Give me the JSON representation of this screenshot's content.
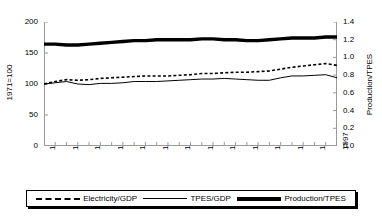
{
  "chart_data": {
    "type": "line",
    "title": "",
    "xlabel": "",
    "ylabel_left": "1971=100",
    "ylabel_right": "Production/TPES",
    "grid": false,
    "legend_position": "bottom",
    "xlim": [
      1971,
      1997
    ],
    "ylim_left": [
      0,
      200
    ],
    "ylim_right": [
      0.0,
      1.4
    ],
    "yticks_left": [
      "0",
      "50",
      "100",
      "150",
      "200"
    ],
    "yticks_right": [
      "0.0",
      "0.2",
      "0.4",
      "0.6",
      "0.8",
      "1.0",
      "1.2",
      "1.4"
    ],
    "x": [
      1971,
      1972,
      1973,
      1974,
      1975,
      1976,
      1977,
      1978,
      1979,
      1980,
      1981,
      1982,
      1983,
      1984,
      1985,
      1986,
      1987,
      1988,
      1989,
      1990,
      1991,
      1992,
      1993,
      1994,
      1995,
      1996,
      1997
    ],
    "xticks": [
      "1971",
      "1972",
      "1973",
      "1974",
      "1975",
      "1976",
      "1977",
      "1978",
      "1979",
      "1980",
      "1981",
      "1982",
      "1983",
      "1984",
      "1985",
      "1986",
      "1987",
      "1988",
      "1989",
      "1990",
      "1991",
      "1992",
      "1993",
      "1994",
      "1995",
      "1996",
      "1997"
    ],
    "xtick_labels_shown": [
      "1971",
      "1973",
      "1975",
      "1977",
      "1979",
      "1981",
      "1983",
      "1985",
      "1987",
      "1989",
      "1991",
      "1993",
      "1995",
      "1997"
    ],
    "series": [
      {
        "name": "Electricity/GDP",
        "style": "dashed",
        "axis": "left",
        "values": [
          100,
          104,
          107,
          106,
          107,
          109,
          110,
          111,
          112,
          113,
          113,
          113,
          114,
          115,
          117,
          117,
          118,
          119,
          119,
          120,
          121,
          124,
          127,
          129,
          131,
          133,
          130
        ]
      },
      {
        "name": "TPES/GDP",
        "style": "thin-solid",
        "axis": "left",
        "values": [
          100,
          102,
          104,
          100,
          99,
          101,
          101,
          102,
          104,
          104,
          104,
          105,
          106,
          107,
          108,
          108,
          109,
          108,
          107,
          106,
          106,
          110,
          113,
          113,
          114,
          115,
          110
        ]
      },
      {
        "name": "Production/TPES",
        "style": "thick-solid",
        "axis": "right",
        "values": [
          1.15,
          1.15,
          1.14,
          1.14,
          1.15,
          1.16,
          1.17,
          1.18,
          1.19,
          1.19,
          1.2,
          1.2,
          1.2,
          1.2,
          1.21,
          1.21,
          1.2,
          1.2,
          1.19,
          1.19,
          1.2,
          1.21,
          1.22,
          1.22,
          1.22,
          1.23,
          1.23
        ]
      }
    ]
  },
  "legend": {
    "items": [
      {
        "label": "Electricity/GDP",
        "swatch": "dashed-line-swatch"
      },
      {
        "label": "TPES/GDP",
        "swatch": "thin-line-swatch"
      },
      {
        "label": "Production/TPES",
        "swatch": "thick-line-swatch"
      }
    ]
  }
}
